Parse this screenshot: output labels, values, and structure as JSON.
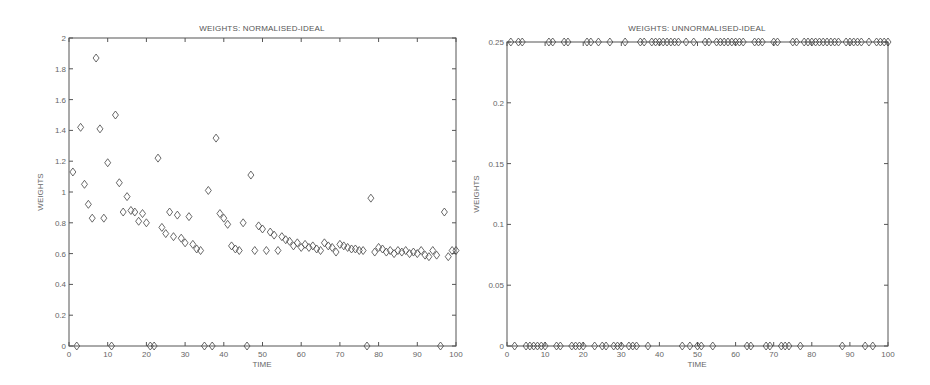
{
  "chart_data": [
    {
      "type": "scatter",
      "title": "WEIGHTS: NORMALISED-IDEAL",
      "xlabel": "TIME",
      "ylabel": "WEIGHTS",
      "xlim": [
        0,
        100
      ],
      "ylim": [
        0,
        2
      ],
      "xticks": [
        "0",
        "10",
        "20",
        "30",
        "40",
        "50",
        "60",
        "70",
        "80",
        "90",
        "100"
      ],
      "yticks": [
        "0",
        "0.2",
        "0.4",
        "0.6",
        "0.8",
        "1",
        "1.2",
        "1.4",
        "1.6",
        "1.8",
        "2"
      ],
      "grid": false,
      "marker": "diamond",
      "series": [
        {
          "name": "weights",
          "x": [
            1,
            2,
            3,
            4,
            5,
            6,
            7,
            8,
            9,
            10,
            11,
            12,
            13,
            14,
            15,
            16,
            17,
            18,
            19,
            20,
            21,
            22,
            23,
            24,
            25,
            26,
            27,
            28,
            29,
            30,
            31,
            32,
            33,
            34,
            35,
            36,
            37,
            38,
            39,
            40,
            41,
            42,
            43,
            44,
            45,
            46,
            47,
            48,
            49,
            50,
            51,
            52,
            53,
            54,
            55,
            56,
            57,
            58,
            59,
            60,
            61,
            62,
            63,
            64,
            65,
            66,
            67,
            68,
            69,
            70,
            71,
            72,
            73,
            74,
            75,
            76,
            77,
            78,
            79,
            80,
            81,
            82,
            83,
            84,
            85,
            86,
            87,
            88,
            89,
            90,
            91,
            92,
            93,
            94,
            95,
            96,
            97,
            98,
            99,
            100
          ],
          "y": [
            1.13,
            0,
            1.42,
            1.05,
            0.92,
            0.83,
            1.87,
            1.41,
            0.83,
            1.19,
            0,
            1.5,
            1.06,
            0.87,
            0.97,
            0.88,
            0.87,
            0.81,
            0.86,
            0.8,
            0,
            0,
            1.22,
            0.77,
            0.73,
            0.87,
            0.71,
            0.85,
            0.7,
            0.67,
            0.84,
            0.66,
            0.63,
            0.62,
            0,
            1.01,
            0,
            1.35,
            0.86,
            0.83,
            0.79,
            0.65,
            0.63,
            0.62,
            0.8,
            0,
            1.11,
            0.62,
            0.78,
            0.76,
            0.62,
            0.74,
            0.72,
            0.62,
            0.71,
            0.69,
            0.68,
            0.65,
            0.67,
            0.64,
            0.66,
            0.64,
            0.65,
            0.63,
            0.62,
            0.67,
            0.65,
            0.64,
            0.61,
            0.66,
            0.65,
            0.64,
            0.63,
            0.63,
            0.62,
            0.62,
            0,
            0.96,
            0.61,
            0.64,
            0.63,
            0.61,
            0.62,
            0.6,
            0.62,
            0.61,
            0.62,
            0.6,
            0.61,
            0.6,
            0.62,
            0.59,
            0.58,
            0.62,
            0.59,
            0,
            0.87,
            0.58,
            0.62,
            0.62
          ]
        }
      ]
    },
    {
      "type": "scatter",
      "title": "WEIGHTS: UNNORMALISED-IDEAL",
      "xlabel": "TIME",
      "ylabel": "WEIGHTS",
      "xlim": [
        0,
        100
      ],
      "ylim": [
        0,
        0.25
      ],
      "xticks": [
        "0",
        "10",
        "20",
        "30",
        "40",
        "50",
        "60",
        "70",
        "80",
        "90",
        "100"
      ],
      "yticks": [
        "0",
        "0.05",
        "0.1",
        "0.15",
        "0.2",
        "0.25"
      ],
      "grid": false,
      "marker": "diamond",
      "series": [
        {
          "name": "weights",
          "x": [
            1,
            2,
            3,
            4,
            5,
            6,
            7,
            8,
            9,
            10,
            11,
            12,
            13,
            14,
            15,
            16,
            17,
            18,
            19,
            20,
            21,
            22,
            23,
            24,
            25,
            26,
            27,
            28,
            29,
            30,
            31,
            32,
            33,
            34,
            35,
            36,
            37,
            38,
            39,
            40,
            41,
            42,
            43,
            44,
            45,
            46,
            47,
            48,
            49,
            50,
            51,
            52,
            53,
            54,
            55,
            56,
            57,
            58,
            59,
            60,
            61,
            62,
            63,
            64,
            65,
            66,
            67,
            68,
            69,
            70,
            71,
            72,
            73,
            74,
            75,
            76,
            77,
            78,
            79,
            80,
            81,
            82,
            83,
            84,
            85,
            86,
            87,
            88,
            89,
            90,
            91,
            92,
            93,
            94,
            95,
            96,
            97,
            98,
            99,
            100
          ],
          "y": [
            0.25,
            0,
            0.25,
            0.25,
            0,
            0,
            0,
            0,
            0,
            0,
            0.25,
            0.25,
            0,
            0,
            0.25,
            0.25,
            0,
            0,
            0,
            0,
            0.25,
            0.25,
            0,
            0.25,
            0,
            0,
            0.25,
            0,
            0,
            0,
            0.25,
            0,
            0,
            0,
            0.25,
            0.25,
            0,
            0.25,
            0.25,
            0.25,
            0.25,
            0.25,
            0.25,
            0.25,
            0.25,
            0,
            0.25,
            0,
            0.25,
            0,
            0,
            0.25,
            0.25,
            0,
            0.25,
            0.25,
            0.25,
            0.25,
            0.25,
            0.25,
            0.25,
            0.25,
            0,
            0,
            0.25,
            0.25,
            0.25,
            0,
            0,
            0.25,
            0.25,
            0,
            0,
            0,
            0.25,
            0.25,
            0,
            0.25,
            0.25,
            0.25,
            0.25,
            0.25,
            0.25,
            0.25,
            0.25,
            0.25,
            0.25,
            0,
            0.25,
            0.25,
            0.25,
            0.25,
            0.25,
            0,
            0.25,
            0,
            0.25,
            0.25,
            0.25,
            0.25
          ]
        }
      ]
    }
  ]
}
